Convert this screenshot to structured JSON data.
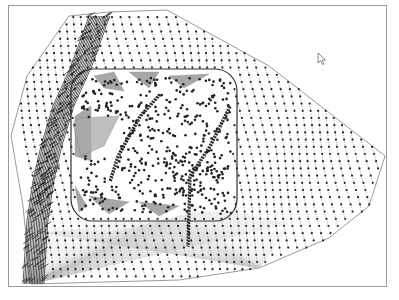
{
  "view": {
    "type": "tin-mesh-viewport",
    "colors": {
      "background": "#ffffff",
      "frame": "#9a9a9a",
      "mesh_line": "#555555",
      "point": "#222222",
      "boundary": "#333333",
      "dense_band": "#1a1a1a",
      "fill_triangles": "#8a8a8a"
    },
    "cursor_icon": "arrow-pointer-icon"
  }
}
